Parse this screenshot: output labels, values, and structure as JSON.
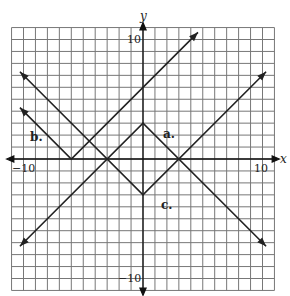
{
  "chart_data": {
    "type": "line",
    "title": "",
    "xlabel": "x",
    "ylabel": "y",
    "xlim": [
      -11,
      11
    ],
    "ylim": [
      -11,
      11
    ],
    "grid": true,
    "tick_labels": {
      "x": [
        "-10",
        "10"
      ],
      "y": [
        "10",
        "-10"
      ]
    },
    "series": [
      {
        "name": "a.",
        "equation": "y = -|x| + 3",
        "vertex": [
          0,
          3
        ],
        "points": [
          [
            -10.3,
            -7.3
          ],
          [
            0,
            3
          ],
          [
            10.3,
            -7.3
          ]
        ]
      },
      {
        "name": "b.",
        "equation": "y = |x + 6|",
        "vertex": [
          -6,
          0
        ],
        "points": [
          [
            -10.3,
            4.3
          ],
          [
            -6,
            0
          ],
          [
            4.6,
            10.6
          ]
        ]
      },
      {
        "name": "c.",
        "equation": "y = |x| - 3",
        "vertex": [
          0,
          -3
        ],
        "points": [
          [
            -10.3,
            7.3
          ],
          [
            0,
            -3
          ],
          [
            10.3,
            7.3
          ]
        ]
      }
    ],
    "annotations": [
      {
        "text": "a.",
        "x": 1.6,
        "y": 2.3
      },
      {
        "text": "b.",
        "x": -9.6,
        "y": 1.8
      },
      {
        "text": "c.",
        "x": 1.5,
        "y": -4.0
      }
    ]
  },
  "labels": {
    "x_axis": "x",
    "y_axis": "y",
    "x_min": "−10",
    "x_max": "10",
    "y_max": "10",
    "y_min": "−10",
    "a": "a.",
    "b": "b.",
    "c": "c."
  }
}
